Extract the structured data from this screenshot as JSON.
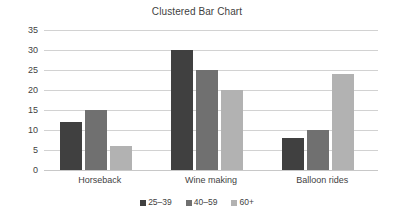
{
  "chart_data": {
    "type": "bar",
    "title": "Clustered Bar Chart",
    "xlabel": "",
    "ylabel": "",
    "categories": [
      "Horseback",
      "Wine making",
      "Balloon rides"
    ],
    "series": [
      {
        "name": "25–39",
        "color": "#404040",
        "values": [
          12,
          30,
          8
        ]
      },
      {
        "name": "40–59",
        "color": "#707070",
        "values": [
          15,
          25,
          10
        ]
      },
      {
        "name": "60+",
        "color": "#b2b2b2",
        "values": [
          6,
          20,
          24
        ]
      }
    ],
    "ylim": [
      0,
      35
    ],
    "yticks": [
      0,
      5,
      10,
      15,
      20,
      25,
      30,
      35
    ],
    "ytick_labels": [
      "0",
      "5",
      "10",
      "15",
      "20",
      "25",
      "30",
      "35"
    ],
    "grid": true,
    "legend_position": "bottom"
  },
  "colors": {
    "gridline": "#d2d2d2",
    "text": "#3f3f3f",
    "background": "#ffffff"
  }
}
